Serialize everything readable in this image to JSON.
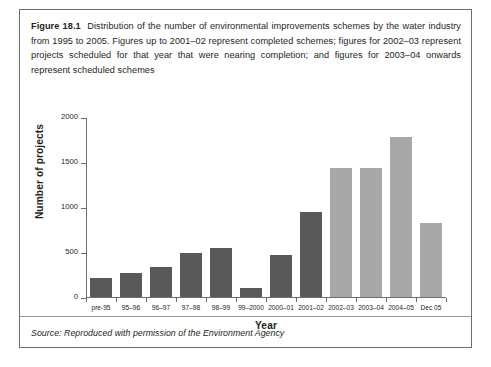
{
  "figure": {
    "label": "Figure 18.1",
    "caption": "Distribution of the number of environmental improvements schemes by the water industry from 1995 to 2005. Figures up to 2001–02 represent completed schemes; figures for 2002–03 represent projects scheduled for that year that were nearing completion; and figures for 2003–04 onwards represent scheduled schemes",
    "source": "Source: Reproduced with permission of the Environment Agency"
  },
  "colors": {
    "bar_completed": "#595959",
    "bar_scheduled": "#a8a8a8",
    "axis": "#6d6e70",
    "border": "#6d6e70",
    "text": "#231f20"
  },
  "chart_data": {
    "type": "bar",
    "title": "",
    "xlabel": "Year",
    "ylabel": "Number of projects",
    "ylim": [
      0,
      2000
    ],
    "yticks": [
      0,
      500,
      1000,
      1500,
      2000
    ],
    "grid": false,
    "legend": "none",
    "categories": [
      "pre-95",
      "95–96",
      "96–97",
      "97–98",
      "98–99",
      "99–2000",
      "2000–01",
      "2001–02",
      "2002–03",
      "2003–04",
      "2004–05",
      "Dec 05"
    ],
    "values": [
      210,
      265,
      335,
      495,
      550,
      100,
      470,
      945,
      1440,
      1440,
      1790,
      830
    ],
    "bar_colors": [
      "#595959",
      "#595959",
      "#595959",
      "#595959",
      "#595959",
      "#595959",
      "#595959",
      "#595959",
      "#a8a8a8",
      "#a8a8a8",
      "#a8a8a8",
      "#a8a8a8"
    ]
  }
}
